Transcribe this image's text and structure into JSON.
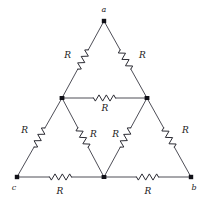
{
  "figure": {
    "background_color": "#ffffff",
    "wire_color": "#3a3a44",
    "label_color": "#1a1a1a",
    "node_color": "#111118",
    "width": 208,
    "height": 203
  },
  "nodes": [
    {
      "id": "a",
      "label": "a",
      "x": 104,
      "y": 21,
      "label_x": 104,
      "label_y": 12,
      "terminal": true
    },
    {
      "id": "c",
      "label": "c",
      "x": 17,
      "y": 177,
      "label_x": 14,
      "label_y": 190,
      "terminal": true
    },
    {
      "id": "b",
      "label": "b",
      "x": 191,
      "y": 177,
      "label_x": 194,
      "label_y": 190,
      "terminal": true
    },
    {
      "id": "ml",
      "label": "",
      "x": 62,
      "y": 98,
      "label_x": 62,
      "label_y": 98,
      "terminal": false
    },
    {
      "id": "mr",
      "label": "",
      "x": 147,
      "y": 98,
      "label_x": 147,
      "label_y": 98,
      "terminal": false
    },
    {
      "id": "mb",
      "label": "",
      "x": 104,
      "y": 177,
      "label_x": 104,
      "label_y": 177,
      "terminal": false
    }
  ],
  "resistors": [
    {
      "id": "r-a-ml",
      "from": "a",
      "to": "ml",
      "label": "R",
      "label_x": 71,
      "label_y": 58,
      "label_anchor": "end"
    },
    {
      "id": "r-a-mr",
      "from": "a",
      "to": "mr",
      "label": "R",
      "label_x": 139,
      "label_y": 58,
      "label_anchor": "start"
    },
    {
      "id": "r-ml-mr",
      "from": "ml",
      "to": "mr",
      "label": "R",
      "label_x": 105,
      "label_y": 111,
      "label_anchor": "middle"
    },
    {
      "id": "r-ml-c",
      "from": "ml",
      "to": "c",
      "label": "R",
      "label_x": 28,
      "label_y": 133,
      "label_anchor": "end"
    },
    {
      "id": "r-ml-mb",
      "from": "ml",
      "to": "mb",
      "label": "R",
      "label_x": 90,
      "label_y": 137,
      "label_anchor": "start"
    },
    {
      "id": "r-mr-mb",
      "from": "mr",
      "to": "mb",
      "label": "R",
      "label_x": 119,
      "label_y": 137,
      "label_anchor": "end"
    },
    {
      "id": "r-mr-b",
      "from": "mr",
      "to": "b",
      "label": "R",
      "label_x": 182,
      "label_y": 133,
      "label_anchor": "start"
    },
    {
      "id": "r-c-mb",
      "from": "c",
      "to": "mb",
      "label": "R",
      "label_x": 60,
      "label_y": 194,
      "label_anchor": "middle"
    },
    {
      "id": "r-mb-b",
      "from": "mb",
      "to": "b",
      "label": "R",
      "label_x": 148,
      "label_y": 194,
      "label_anchor": "middle"
    }
  ],
  "resistance_value": "R",
  "resistor_count": 9,
  "terminal_labels": [
    "a",
    "b",
    "c"
  ]
}
